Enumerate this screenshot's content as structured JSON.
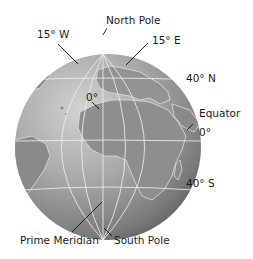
{
  "diagram": {
    "type": "globe-coordinate-diagram",
    "labels": {
      "north_pole": "North Pole",
      "south_pole": "South Pole",
      "lon_15w": "15° W",
      "lon_15e": "15° E",
      "origin": "0°",
      "lat_40n": "40° N",
      "equator": "Equator",
      "equator_deg": "0°",
      "lat_40s": "40° S",
      "prime_meridian": "Prime Meridian"
    },
    "colors": {
      "globe_light": "#cfcfcf",
      "globe_mid": "#9a9a9a",
      "globe_dark": "#555555",
      "land": "#8a8a8a",
      "grid_lines": "#e8e8e8",
      "leader_lines": "#111111",
      "text": "#1a1a1a"
    }
  }
}
